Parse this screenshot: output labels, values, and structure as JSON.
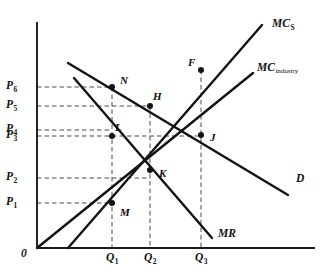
{
  "figure": {
    "origin_label": "0",
    "axis_color": "#1a1a1a",
    "curve_color": "#121212",
    "guide_color": "#4a4a4a",
    "background": "#ffffff"
  },
  "chart_data": {
    "type": "line",
    "title": "",
    "xlabel": "Quantity",
    "ylabel": "Price",
    "xlim": [
      0,
      329
    ],
    "ylim": [
      0,
      278
    ],
    "grid": false,
    "legend": "inline-curve-labels",
    "price_axis_ticks": [
      {
        "label": "P",
        "sub": "6",
        "y": 87
      },
      {
        "label": "P",
        "sub": "5",
        "y": 106
      },
      {
        "label": "P",
        "sub": "4",
        "y": 130
      },
      {
        "label": "P",
        "sub": "3",
        "y": 136
      },
      {
        "label": "P",
        "sub": "2",
        "y": 178
      },
      {
        "label": "P",
        "sub": "1",
        "y": 203
      }
    ],
    "quantity_axis_ticks": [
      {
        "label": "Q",
        "sub": "1",
        "x": 112
      },
      {
        "label": "Q",
        "sub": "2",
        "x": 150
      },
      {
        "label": "Q",
        "sub": "3",
        "x": 201
      }
    ],
    "series": [
      {
        "name": "MC",
        "sub": "S",
        "kind": "marginal-cost-single-firm",
        "label_x": 272,
        "label_y": 18,
        "x1": 68,
        "y1": 248,
        "x2": 262,
        "y2": 25
      },
      {
        "name": "MC",
        "sub": "industry",
        "kind": "marginal-cost-industry",
        "label_x": 257,
        "label_y": 62,
        "x1": 37,
        "y1": 248,
        "x2": 253,
        "y2": 73
      },
      {
        "name": "D",
        "sub": "",
        "kind": "demand",
        "label_x": 296,
        "label_y": 173,
        "x1": 68,
        "y1": 63,
        "x2": 288,
        "y2": 195
      },
      {
        "name": "MR",
        "sub": "",
        "kind": "marginal-revenue",
        "label_x": 218,
        "label_y": 228,
        "x1": 74,
        "y1": 78,
        "x2": 212,
        "y2": 238
      }
    ],
    "points": [
      {
        "label": "N",
        "x": 112,
        "y": 87,
        "label_dx": 8,
        "label_dy": -12
      },
      {
        "label": "H",
        "x": 150,
        "y": 106,
        "label_dx": 3,
        "label_dy": -15
      },
      {
        "label": "F",
        "x": 201,
        "y": 70,
        "label_dx": -13,
        "label_dy": -13
      },
      {
        "label": "L",
        "x": 112,
        "y": 136,
        "label_dx": 3,
        "label_dy": -14
      },
      {
        "label": "J",
        "x": 201,
        "y": 135,
        "label_dx": 9,
        "label_dy": -3
      },
      {
        "label": "K",
        "x": 150,
        "y": 170,
        "label_dx": 9,
        "label_dy": -2
      },
      {
        "label": "M",
        "x": 112,
        "y": 203,
        "label_dx": 8,
        "label_dy": 4
      }
    ],
    "guides_horizontal": [
      {
        "from_x": 37,
        "to_x": 112,
        "y": 87
      },
      {
        "from_x": 37,
        "to_x": 150,
        "y": 106
      },
      {
        "from_x": 37,
        "to_x": 112,
        "y": 130
      },
      {
        "from_x": 37,
        "to_x": 201,
        "y": 136
      },
      {
        "from_x": 37,
        "to_x": 150,
        "y": 178
      },
      {
        "from_x": 37,
        "to_x": 112,
        "y": 203
      }
    ],
    "guides_vertical": [
      {
        "x": 112,
        "from_y": 87,
        "to_y": 248
      },
      {
        "x": 150,
        "from_y": 106,
        "to_y": 248
      },
      {
        "x": 201,
        "from_y": 70,
        "to_y": 248
      }
    ]
  }
}
